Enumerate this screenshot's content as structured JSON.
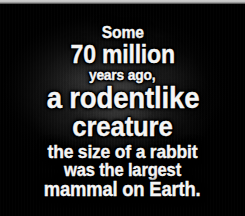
{
  "image": {
    "type": "title-card",
    "background_color": "#000000",
    "text_color": "#ffffff",
    "outline_color": "#000000",
    "top_band_color": "#d0d0d0"
  },
  "caption": {
    "full_text": "Some 70 million years ago, a rodentlike creature the size of a rabbit was the largest mammal on Earth.",
    "lines": [
      {
        "text": "Some"
      },
      {
        "text": "70 million"
      },
      {
        "text": "years ago,"
      },
      {
        "text": "a rodentlike"
      },
      {
        "text": "creature"
      },
      {
        "text": "the size of a rabbit"
      },
      {
        "text": "was the largest"
      },
      {
        "text": "mammal on Earth."
      }
    ]
  }
}
